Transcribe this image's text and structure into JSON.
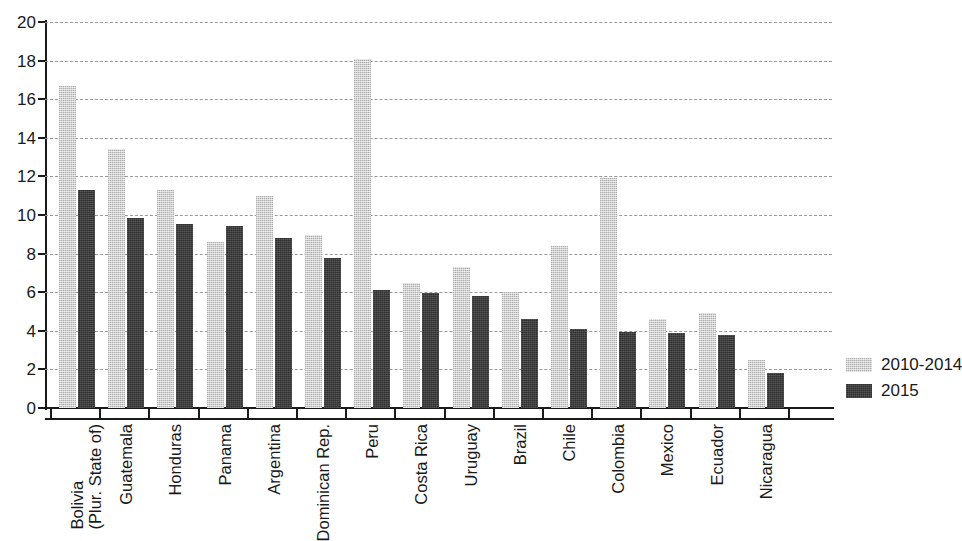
{
  "chart_data": {
    "type": "bar",
    "title": "",
    "subtitle": "",
    "xlabel": "",
    "ylabel": "",
    "ylim": [
      0,
      20
    ],
    "ytick_step": 2,
    "yticks": [
      "0",
      "2",
      "4",
      "6",
      "8",
      "10",
      "12",
      "14",
      "16",
      "18",
      "20"
    ],
    "grid": true,
    "grid_style": "horizontal-dashed",
    "legend_position": "right",
    "orientation": "vertical",
    "grouping": "grouped",
    "categories": [
      "Bolivia (Plur. State of)",
      "Guatemala",
      "Honduras",
      "Panama",
      "Argentina",
      "Dominican Rep.",
      "Peru",
      "Costa Rica",
      "Uruguay",
      "Brazil",
      "Chile",
      "Colombia",
      "Mexico",
      "Ecuador",
      "Nicaragua"
    ],
    "category_lines": [
      [
        "Bolivia",
        "(Plur. State of)"
      ],
      [
        "Guatemala",
        ""
      ],
      [
        "Honduras",
        ""
      ],
      [
        "Panama",
        ""
      ],
      [
        "Argentina",
        ""
      ],
      [
        "Dominican Rep.",
        ""
      ],
      [
        "Peru",
        ""
      ],
      [
        "Costa Rica",
        ""
      ],
      [
        "Uruguay",
        ""
      ],
      [
        "Brazil",
        ""
      ],
      [
        "Chile",
        ""
      ],
      [
        "Colombia",
        ""
      ],
      [
        "Mexico",
        ""
      ],
      [
        "Ecuador",
        ""
      ],
      [
        "Nicaragua",
        ""
      ]
    ],
    "series": [
      {
        "name": "2010-2014",
        "color": "#c9c9c9",
        "values": [
          16.7,
          13.4,
          11.3,
          8.6,
          11.0,
          8.95,
          18.1,
          6.5,
          7.3,
          6.0,
          8.4,
          11.9,
          4.6,
          4.9,
          2.5
        ]
      },
      {
        "name": "2015",
        "color": "#3d3d3d",
        "values": [
          11.3,
          9.85,
          9.55,
          9.45,
          8.8,
          7.75,
          6.1,
          5.95,
          5.8,
          4.6,
          4.1,
          3.95,
          3.9,
          3.8,
          1.8
        ]
      }
    ]
  },
  "legend": {
    "items": [
      {
        "label": "2010-2014",
        "swatch": "prev"
      },
      {
        "label": "2015",
        "swatch": "curr"
      }
    ]
  }
}
